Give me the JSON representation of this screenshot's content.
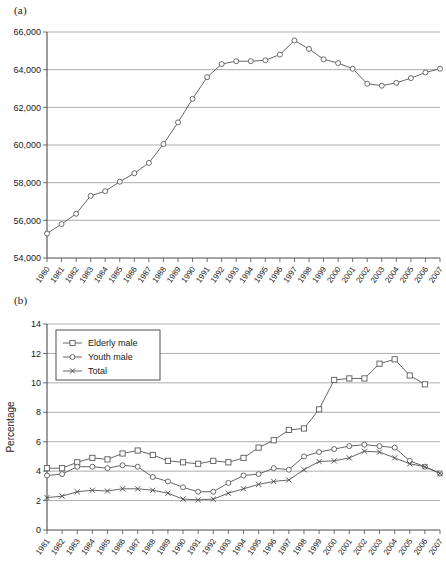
{
  "figure": {
    "panel_a_label": "(a)",
    "panel_b_label": "(b)"
  },
  "chart_data": [
    {
      "id": "panel-a",
      "type": "line",
      "title": "",
      "xlabel": "",
      "ylabel": "",
      "ylim": [
        54000,
        66000
      ],
      "yticks": [
        54000,
        56000,
        58000,
        60000,
        62000,
        64000,
        66000
      ],
      "ytick_labels": [
        "54,000",
        "56,000",
        "58,000",
        "60,000",
        "62,000",
        "64,000",
        "66,000"
      ],
      "grid": true,
      "legend": "none",
      "marker": "circle",
      "categories": [
        "1980",
        "1981",
        "1982",
        "1983",
        "1984",
        "1985",
        "1986",
        "1987",
        "1988",
        "1989",
        "1990",
        "1991",
        "1992",
        "1993",
        "1994",
        "1995",
        "1996",
        "1997",
        "1998",
        "1999",
        "2000",
        "2001",
        "2002",
        "2003",
        "2004",
        "2005",
        "2006",
        "2007"
      ],
      "series": [
        {
          "name": "Total",
          "values": [
            55300,
            55800,
            56350,
            57300,
            57550,
            58050,
            58500,
            59050,
            60050,
            61200,
            62450,
            63600,
            64300,
            64450,
            64450,
            64500,
            64800,
            65550,
            65100,
            64550,
            64350,
            64050,
            63250,
            63150,
            63300,
            63550,
            63850,
            64050
          ]
        }
      ]
    },
    {
      "id": "panel-b",
      "type": "line",
      "title": "",
      "xlabel": "",
      "ylabel": "Percentage",
      "ylim": [
        0,
        14
      ],
      "yticks": [
        0,
        2,
        4,
        6,
        8,
        10,
        12,
        14
      ],
      "ytick_labels": [
        "0",
        "2",
        "4",
        "6",
        "8",
        "10",
        "12",
        "14"
      ],
      "grid": true,
      "legend": "upper left",
      "categories": [
        "1981",
        "1982",
        "1983",
        "1984",
        "1985",
        "1986",
        "1987",
        "1988",
        "1989",
        "1990",
        "1991",
        "1992",
        "1993",
        "1994",
        "1995",
        "1996",
        "1997",
        "1998",
        "1999",
        "2000",
        "2001",
        "2002",
        "2003",
        "2004",
        "2005",
        "2006",
        "2007"
      ],
      "series": [
        {
          "name": "Elderly male",
          "marker": "square",
          "values": [
            4.2,
            4.2,
            4.6,
            4.9,
            4.8,
            5.2,
            5.4,
            5.1,
            4.7,
            4.6,
            4.5,
            4.7,
            4.6,
            4.9,
            5.6,
            6.1,
            6.8,
            6.9,
            8.2,
            10.2,
            10.3,
            10.3,
            11.3,
            11.6,
            10.5,
            9.9,
            null
          ]
        },
        {
          "name": "Youth male",
          "marker": "circle",
          "values": [
            3.7,
            3.8,
            4.3,
            4.3,
            4.2,
            4.4,
            4.3,
            3.6,
            3.3,
            2.9,
            2.6,
            2.6,
            3.2,
            3.7,
            3.8,
            4.2,
            4.1,
            5.0,
            5.3,
            5.5,
            5.7,
            5.8,
            5.7,
            5.6,
            4.7,
            4.3,
            3.85
          ]
        },
        {
          "name": "Total",
          "marker": "x",
          "values": [
            2.2,
            2.3,
            2.6,
            2.7,
            2.65,
            2.8,
            2.8,
            2.7,
            2.5,
            2.1,
            2.05,
            2.1,
            2.5,
            2.8,
            3.1,
            3.3,
            3.4,
            4.1,
            4.65,
            4.7,
            4.9,
            5.35,
            5.3,
            4.9,
            4.5,
            4.3,
            3.85
          ]
        }
      ]
    }
  ]
}
